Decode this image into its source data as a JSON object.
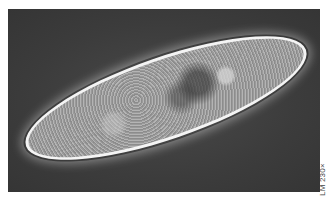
{
  "image": {
    "subject": "paramecium",
    "description": "Light micrograph of a paramecium, elongated oval cell with bright outline on dark background",
    "background_color": "#3c3c3c",
    "cell_outline_color": "#f4f4f4",
    "cell_fill_color": "#a8a8a8"
  },
  "caption": {
    "magnification_label": "LM 230×"
  }
}
